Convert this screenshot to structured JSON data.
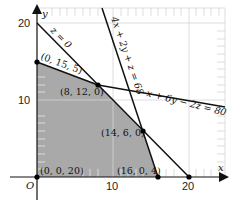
{
  "colors": {
    "shade": "#a9a9a9",
    "grid": "#d6d6d6",
    "line": "#111111",
    "point": "#000000"
  },
  "axes": {
    "x_label": "x",
    "y_label": "y",
    "origin_label": "O",
    "x_ticks": [
      "10",
      "20"
    ],
    "y_ticks": [
      "10",
      "20"
    ]
  },
  "points": [
    {
      "label": "(0, 15, 5)",
      "x": 0,
      "y": 15
    },
    {
      "label": "(8, 12, 0)",
      "x": 8,
      "y": 12
    },
    {
      "label": "(14, 6, 0)",
      "x": 14,
      "y": 6
    },
    {
      "label": "(16, 0, 4)",
      "x": 16,
      "y": 0
    },
    {
      "label": "(0, 0, 20)",
      "x": 0,
      "y": 0
    },
    {
      "label": "",
      "x": 20,
      "y": 0
    }
  ],
  "lines": {
    "z_zero": "z = 0",
    "constraint_a": "4x + 2y + z = 68",
    "constraint_b": "x + 6y − 2z = 80"
  }
}
